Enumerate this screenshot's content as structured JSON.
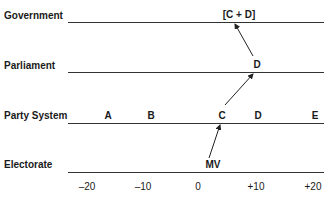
{
  "levels": [
    {
      "label": "Government"
    },
    {
      "label": "Parliament"
    },
    {
      "label": "Party System"
    },
    {
      "label": "Electorate"
    }
  ],
  "government": {
    "coalition": "[C  +  D]"
  },
  "parliament": {
    "party": "D"
  },
  "party_system": {
    "parties": [
      "A",
      "B",
      "C",
      "D",
      "E"
    ]
  },
  "electorate": {
    "median_voter": "MV"
  },
  "axis": {
    "ticks": [
      "–20",
      "–10",
      "0",
      "+10",
      "+20"
    ]
  }
}
